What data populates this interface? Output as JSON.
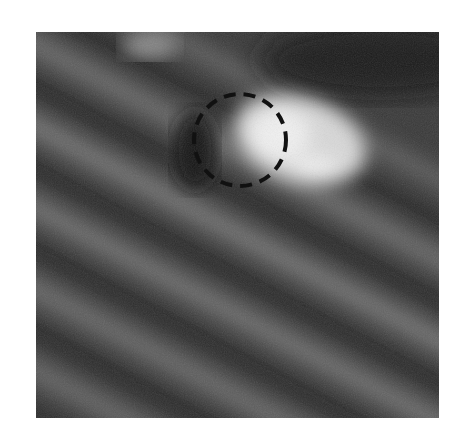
{
  "figure": {
    "type": "grayscale-micrograph",
    "colors": {
      "background": "#3a3a3a",
      "stripe_light": "#6e6e6e",
      "stripe_dark": "#262626",
      "blob": "#e8e8e8",
      "annotation": "#111111"
    },
    "annotation": {
      "shape": "dashed-circle",
      "center_x": 240,
      "center_y": 140,
      "radius": 46
    }
  }
}
